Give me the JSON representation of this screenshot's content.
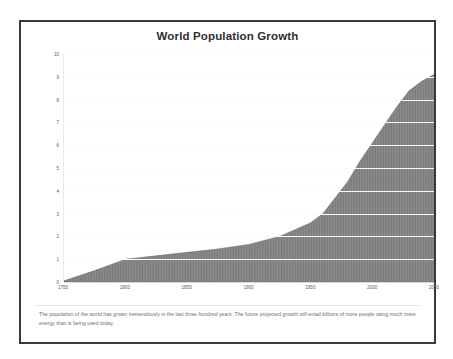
{
  "figure": {
    "title": "World Population Growth",
    "caption": "The population of the world has grown tremendously in the last three hundred years. The future projected growth will entail billions of more people using much more energy than is being used today.",
    "border_color": "#3a3a3c",
    "background_color": "#ffffff"
  },
  "chart_data": {
    "type": "area",
    "title": "World Population Growth",
    "xlabel": "",
    "ylabel": "World Population (billions)",
    "xlim": [
      1750,
      2050
    ],
    "ylim": [
      0,
      10
    ],
    "grid": true,
    "legend": false,
    "fill_color": "#8a8a8a",
    "fill_pattern": "vertical-hatch",
    "x_ticks": [
      "1750",
      "1800",
      "1850",
      "1900",
      "1950",
      "2000",
      "2050"
    ],
    "y_ticks": [
      "0",
      "1",
      "2",
      "3",
      "4",
      "5",
      "6",
      "7",
      "8",
      "9",
      "10"
    ],
    "x": [
      1750,
      1775,
      1800,
      1825,
      1850,
      1875,
      1900,
      1925,
      1950,
      1960,
      1970,
      1980,
      1990,
      2000,
      2010,
      2020,
      2030,
      2040,
      2050
    ],
    "values": [
      0.05,
      0.5,
      1.0,
      1.15,
      1.3,
      1.45,
      1.65,
      2.0,
      2.6,
      3.0,
      3.7,
      4.4,
      5.3,
      6.1,
      6.9,
      7.7,
      8.4,
      8.8,
      9.1
    ],
    "series": [
      {
        "name": "World population",
        "values": [
          0.05,
          0.5,
          1.0,
          1.15,
          1.3,
          1.45,
          1.65,
          2.0,
          2.6,
          3.0,
          3.7,
          4.4,
          5.3,
          6.1,
          6.9,
          7.7,
          8.4,
          8.8,
          9.1
        ]
      }
    ],
    "annotations": []
  }
}
